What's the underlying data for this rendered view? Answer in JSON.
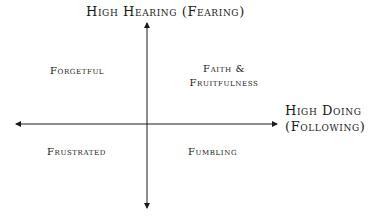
{
  "diagram": {
    "type": "quadrant",
    "axes": {
      "vertical": {
        "label": "High Hearing (Fearing)"
      },
      "horizontal": {
        "label_line1": "High Doing",
        "label_line2": "(Following)"
      }
    },
    "quadrants": {
      "top_left": "Forgetful",
      "top_right_line1": "Faith &",
      "top_right_line2": "Fruitfulness",
      "bottom_left": "Frustrated",
      "bottom_right": "Fumbling"
    },
    "colors": {
      "axis": "#1a1a1a",
      "text": "#1a1a1a",
      "background": "#ffffff"
    }
  }
}
